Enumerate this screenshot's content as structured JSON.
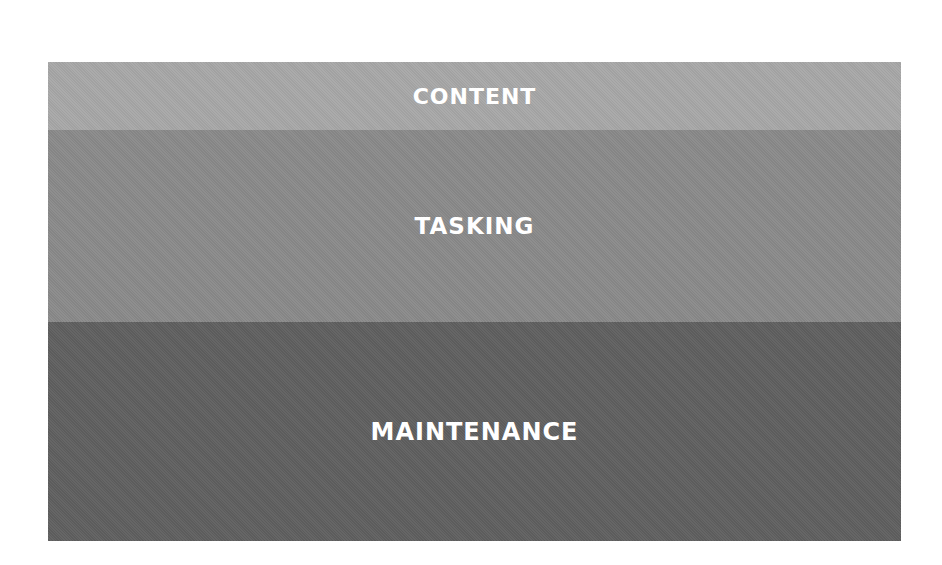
{
  "diagram": {
    "layers": [
      {
        "label": "CONTENT",
        "color": "#a8a8a8"
      },
      {
        "label": "TASKING",
        "color": "#8a8a8a"
      },
      {
        "label": "MAINTENANCE",
        "color": "#606060"
      }
    ]
  }
}
